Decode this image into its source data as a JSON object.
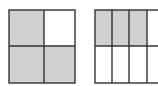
{
  "colors": {
    "shaded": "#d0d0d0",
    "unshaded": "#ffffff",
    "line": "#333333"
  },
  "figures": [
    {
      "name": "square-fraction",
      "rows": 2,
      "cols": 2,
      "shaded_cells": [
        [
          0,
          0
        ],
        [
          1,
          0
        ],
        [
          1,
          1
        ]
      ],
      "fraction": "3/4"
    },
    {
      "name": "rectangle-fraction",
      "rows": 2,
      "cols": 4,
      "shaded_cells": [
        [
          0,
          0
        ],
        [
          0,
          1
        ],
        [
          0,
          2
        ]
      ],
      "fraction": "3/8"
    }
  ]
}
